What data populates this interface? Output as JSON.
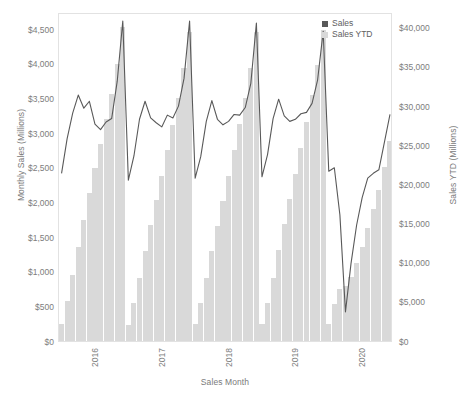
{
  "chart_data": {
    "type": "bar",
    "title": "",
    "subtitle": "",
    "xlabel": "Sales Month",
    "ylabel": "Monthly Sales (Millions)",
    "y2label": "Sales YTD (Millions)",
    "grid": false,
    "legend_position": "top-right",
    "ylim": [
      0,
      4750
    ],
    "y2lim": [
      0,
      42000
    ],
    "yticks": [
      0,
      500,
      1000,
      1500,
      2000,
      2500,
      3000,
      3500,
      4000,
      4500
    ],
    "ytick_labels": [
      "$0",
      "$500",
      "$1,000",
      "$1,500",
      "$2,000",
      "$2,500",
      "$3,000",
      "$3,500",
      "$4,000",
      "$4,500"
    ],
    "y2ticks": [
      0,
      5000,
      10000,
      15000,
      20000,
      25000,
      30000,
      35000,
      40000
    ],
    "y2tick_labels": [
      "$0",
      "$5,000",
      "$10,000",
      "$15,000",
      "$20,000",
      "$25,000",
      "$30,000",
      "$35,000",
      "$40,000"
    ],
    "xticks": [
      6,
      18,
      30,
      42,
      54
    ],
    "xtick_labels": [
      "2016",
      "2017",
      "2018",
      "2019",
      "2020"
    ],
    "colors": {
      "sales_line": "#595959",
      "ytd_bar": "#d9d9d9",
      "legend_sales": "#595959",
      "legend_ytd": "#d9d9d9",
      "axis_text": "#7d7d7d",
      "frame": "#e2e2e2",
      "background": "#ffffff"
    },
    "categories": [
      "2016-01",
      "2016-02",
      "2016-03",
      "2016-04",
      "2016-05",
      "2016-06",
      "2016-07",
      "2016-08",
      "2016-09",
      "2016-10",
      "2016-11",
      "2016-12",
      "2017-01",
      "2017-02",
      "2017-03",
      "2017-04",
      "2017-05",
      "2017-06",
      "2017-07",
      "2017-08",
      "2017-09",
      "2017-10",
      "2017-11",
      "2017-12",
      "2018-01",
      "2018-02",
      "2018-03",
      "2018-04",
      "2018-05",
      "2018-06",
      "2018-07",
      "2018-08",
      "2018-09",
      "2018-10",
      "2018-11",
      "2018-12",
      "2019-01",
      "2019-02",
      "2019-03",
      "2019-04",
      "2019-05",
      "2019-06",
      "2019-07",
      "2019-08",
      "2019-09",
      "2019-10",
      "2019-11",
      "2019-12",
      "2020-01",
      "2020-02",
      "2020-03",
      "2020-04",
      "2020-05",
      "2020-06",
      "2020-07",
      "2020-08",
      "2020-09",
      "2020-10",
      "2020-11",
      "2020-12"
    ],
    "series": [
      {
        "name": "Sales",
        "type": "line",
        "axis": "left",
        "color": "#595959",
        "values": [
          2450,
          2950,
          3320,
          3580,
          3390,
          3490,
          3160,
          3080,
          3190,
          3240,
          3780,
          4650,
          2350,
          2700,
          3230,
          3490,
          3250,
          3180,
          3120,
          3290,
          3250,
          3420,
          3820,
          4650,
          2380,
          2690,
          3200,
          3500,
          3230,
          3150,
          3200,
          3300,
          3290,
          3400,
          3750,
          4620,
          2400,
          2720,
          3240,
          3520,
          3280,
          3200,
          3230,
          3310,
          3330,
          3460,
          3800,
          4500,
          2480,
          2530,
          1850,
          450,
          1150,
          1700,
          2100,
          2380,
          2450,
          2500,
          2900,
          3300
        ]
      },
      {
        "name": "Sales YTD",
        "type": "bar",
        "axis": "right",
        "color": "#d9d9d9",
        "values": [
          2450,
          5400,
          8720,
          12300,
          15690,
          19180,
          22340,
          25420,
          28610,
          31850,
          35630,
          40280,
          2350,
          5050,
          8280,
          11770,
          15020,
          18200,
          21320,
          24610,
          27860,
          31280,
          35100,
          39750,
          2380,
          5070,
          8270,
          11770,
          15000,
          18150,
          21350,
          24650,
          27940,
          31340,
          35090,
          39710,
          2400,
          5120,
          8360,
          11880,
          15160,
          18360,
          21590,
          24900,
          28230,
          31690,
          35490,
          39990,
          2480,
          5010,
          6860,
          7310,
          8460,
          10160,
          12260,
          14640,
          17090,
          19590,
          22490,
          25790
        ]
      }
    ]
  },
  "legend": {
    "items": [
      {
        "label": "Sales",
        "color": "#595959"
      },
      {
        "label": "Sales YTD",
        "color": "#d9d9d9"
      }
    ]
  }
}
